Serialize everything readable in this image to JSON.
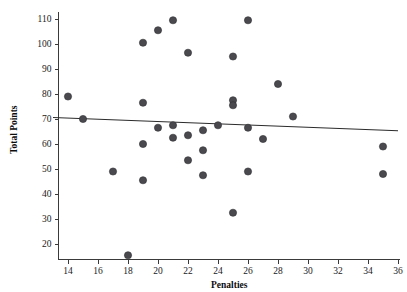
{
  "chart_data": {
    "type": "scatter",
    "title": "",
    "xlabel": "Penalties",
    "ylabel": "Total Points",
    "xlim": [
      13,
      36
    ],
    "ylim": [
      13,
      114
    ],
    "xticks": [
      14,
      16,
      18,
      20,
      22,
      24,
      26,
      28,
      30,
      32,
      34,
      36
    ],
    "yticks": [
      20,
      30,
      40,
      50,
      60,
      70,
      80,
      90,
      100,
      110
    ],
    "grid": false,
    "legend": null,
    "point_color": "#4a4a4e",
    "line_color": "#2b2b2b",
    "points": [
      {
        "x": 14,
        "y": 79
      },
      {
        "x": 15,
        "y": 70
      },
      {
        "x": 17,
        "y": 49
      },
      {
        "x": 18,
        "y": 15.5
      },
      {
        "x": 19,
        "y": 100.5
      },
      {
        "x": 19,
        "y": 76.5
      },
      {
        "x": 19,
        "y": 60
      },
      {
        "x": 19,
        "y": 45.5
      },
      {
        "x": 20,
        "y": 105.5
      },
      {
        "x": 20,
        "y": 66.5
      },
      {
        "x": 21,
        "y": 109.5
      },
      {
        "x": 21,
        "y": 67.5
      },
      {
        "x": 21,
        "y": 62.5
      },
      {
        "x": 22,
        "y": 96.5
      },
      {
        "x": 22,
        "y": 63.5
      },
      {
        "x": 22,
        "y": 53.5
      },
      {
        "x": 23,
        "y": 65.5
      },
      {
        "x": 23,
        "y": 57.5
      },
      {
        "x": 23,
        "y": 47.5
      },
      {
        "x": 24,
        "y": 67.5
      },
      {
        "x": 25,
        "y": 95
      },
      {
        "x": 25,
        "y": 77.5
      },
      {
        "x": 25,
        "y": 75.5
      },
      {
        "x": 25,
        "y": 32.5
      },
      {
        "x": 26,
        "y": 109.5
      },
      {
        "x": 26,
        "y": 66.5
      },
      {
        "x": 26,
        "y": 49
      },
      {
        "x": 27,
        "y": 62
      },
      {
        "x": 28,
        "y": 84
      },
      {
        "x": 29,
        "y": 71
      },
      {
        "x": 35,
        "y": 59
      },
      {
        "x": 35,
        "y": 48
      }
    ],
    "trend_line": {
      "x_start": 13,
      "y_start": 70.6,
      "x_end": 36,
      "y_end": 65.3
    }
  }
}
